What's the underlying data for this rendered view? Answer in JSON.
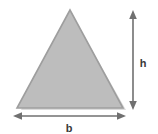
{
  "diagram": {
    "type": "triangle-area-dimensions",
    "background_color": "#ffffff",
    "shape": {
      "name": "triangle",
      "fill_color": "#bdbdbd",
      "stroke_color": "#9a9a9a",
      "shadow_color": "#d8d8d8",
      "apex": {
        "x": 70,
        "y": 10
      },
      "bottom_left": {
        "x": 17,
        "y": 108
      },
      "bottom_right": {
        "x": 123,
        "y": 108
      }
    },
    "labels": {
      "height": "h",
      "base": "b"
    },
    "arrows": [
      {
        "name": "height-arrow",
        "orientation": "vertical",
        "label": "h",
        "color": "#6e6e6e",
        "x": 133,
        "y_start": 12,
        "y_end": 109,
        "label_x": 143,
        "label_y": 63
      },
      {
        "name": "base-arrow",
        "orientation": "horizontal",
        "label": "b",
        "color": "#6e6e6e",
        "y": 116,
        "x_start": 14,
        "x_end": 125,
        "label_x": 69,
        "label_y": 131
      }
    ]
  }
}
